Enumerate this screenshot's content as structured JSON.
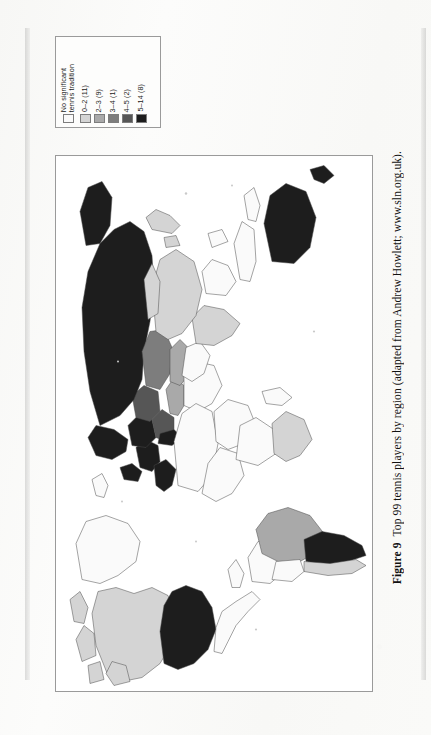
{
  "figure": {
    "label": "Figure 9",
    "caption": "Top 99 tennis players by region (adapted from Andrew Howlett; www.sln.org.uk)."
  },
  "legend": {
    "title": "",
    "items": [
      {
        "label": "No significant\ntennis tradition",
        "color": "#fafafa",
        "count": null
      },
      {
        "label": "0–2 (11)",
        "color": "#d4d4d4",
        "count": 11
      },
      {
        "label": "2–3 (9)",
        "color": "#a9a9a9",
        "count": 9
      },
      {
        "label": "3–4 (1)",
        "color": "#7d7d7d",
        "count": 1
      },
      {
        "label": "4–5 (2)",
        "color": "#565656",
        "count": 2
      },
      {
        "label": "5–14 (8)",
        "color": "#1d1d1d",
        "count": 8
      }
    ]
  },
  "chart_data": {
    "type": "map",
    "title": "Top 99 tennis players by region",
    "subtitle": "adapted from Andrew Howlett; www.sln.org.uk",
    "orientation": "page rotated 90 degrees counter-clockwise",
    "projection": "world choropleth",
    "legend_position": "top-left, rotated labels",
    "classes": [
      {
        "label": "No significant tennis tradition",
        "color": "#fafafa",
        "regions": 0
      },
      {
        "label": "0–2",
        "color": "#d4d4d4",
        "regions": 11
      },
      {
        "label": "2–3",
        "color": "#a9a9a9",
        "regions": 9
      },
      {
        "label": "3–4",
        "color": "#7d7d7d",
        "regions": 1
      },
      {
        "label": "4–5",
        "color": "#565656",
        "regions": 2
      },
      {
        "label": "5–14",
        "color": "#1d1d1d",
        "regions": 8
      }
    ],
    "regions": [
      {
        "name": "Russia / Northern Eurasia",
        "class": "5–14",
        "color": "#1d1d1d"
      },
      {
        "name": "Scandinavia",
        "class": "5–14",
        "color": "#1d1d1d"
      },
      {
        "name": "Central Europe",
        "class": "5–14",
        "color": "#1d1d1d"
      },
      {
        "name": "Western Europe",
        "class": "5–14",
        "color": "#1d1d1d"
      },
      {
        "name": "Spain",
        "class": "5–14",
        "color": "#1d1d1d"
      },
      {
        "name": "Australia",
        "class": "5–14",
        "color": "#1d1d1d"
      },
      {
        "name": "United States",
        "class": "5–14",
        "color": "#1d1d1d"
      },
      {
        "name": "Argentina",
        "class": "5–14",
        "color": "#1d1d1d"
      },
      {
        "name": "Ukraine / Eastern Europe",
        "class": "4–5",
        "color": "#565656"
      },
      {
        "name": "Balkans",
        "class": "4–5",
        "color": "#565656"
      },
      {
        "name": "Kazakhstan region",
        "class": "3–4",
        "color": "#7d7d7d"
      },
      {
        "name": "Central Asia",
        "class": "2–3",
        "color": "#a9a9a9"
      },
      {
        "name": "Turkey / Anatolia",
        "class": "2–3",
        "color": "#a9a9a9"
      },
      {
        "name": "Brazil",
        "class": "2–3",
        "color": "#a9a9a9"
      },
      {
        "name": "Canada",
        "class": "0–2",
        "color": "#d4d4d4"
      },
      {
        "name": "Chile",
        "class": "0–2",
        "color": "#d4d4d4"
      },
      {
        "name": "Southern Africa",
        "class": "0–2",
        "color": "#d4d4d4"
      },
      {
        "name": "India",
        "class": "0–2",
        "color": "#d4d4d4"
      },
      {
        "name": "China",
        "class": "0–2",
        "color": "#d4d4d4"
      },
      {
        "name": "Japan",
        "class": "0–2",
        "color": "#d4d4d4"
      },
      {
        "name": "North Africa",
        "class": "No significant tennis tradition",
        "color": "#fafafa"
      },
      {
        "name": "Sub-Saharan Africa",
        "class": "No significant tennis tradition",
        "color": "#fafafa"
      },
      {
        "name": "Middle East",
        "class": "No significant tennis tradition",
        "color": "#fafafa"
      },
      {
        "name": "Southeast Asia",
        "class": "No significant tennis tradition",
        "color": "#fafafa"
      },
      {
        "name": "Greenland",
        "class": "No significant tennis tradition",
        "color": "#fafafa"
      }
    ]
  }
}
